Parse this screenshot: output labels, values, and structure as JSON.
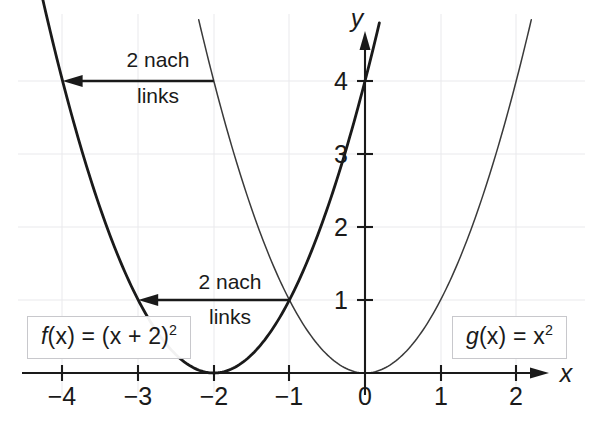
{
  "chart_data": {
    "type": "line",
    "title": "",
    "xlabel": "x",
    "ylabel": "y",
    "xlim": [
      -4.6,
      2.55
    ],
    "ylim": [
      -0.45,
      4.9
    ],
    "grid": true,
    "legend": "inline-boxes",
    "x_ticks": [
      "−4",
      "−3",
      "−2",
      "−1",
      "0",
      "1",
      "2"
    ],
    "x_tick_values": [
      -4,
      -3,
      -2,
      -1,
      0,
      1,
      2
    ],
    "y_ticks": [
      "1",
      "2",
      "3",
      "4"
    ],
    "y_tick_values": [
      1,
      2,
      3,
      4
    ],
    "series": [
      {
        "name": "f(x) = (x + 2)²",
        "expression": "(x + 2)^2",
        "style": "bold",
        "vertex": [
          -2,
          0
        ],
        "x": [
          -4.3,
          -4.0,
          -3.5,
          -3.0,
          -2.5,
          -2.0,
          -1.5,
          -1.0,
          -0.5,
          0.0,
          0.19
        ],
        "values": [
          5.29,
          4.0,
          2.25,
          1.0,
          0.25,
          0.0,
          0.25,
          1.0,
          2.25,
          4.0,
          4.8
        ]
      },
      {
        "name": "g(x) = x²",
        "expression": "x^2",
        "style": "thin",
        "vertex": [
          0,
          0
        ],
        "x": [
          -2.2,
          -2.0,
          -1.5,
          -1.0,
          -0.5,
          0.0,
          0.5,
          1.0,
          1.5,
          2.0,
          2.2
        ],
        "values": [
          4.84,
          4.0,
          2.25,
          1.0,
          0.25,
          0.0,
          0.25,
          1.0,
          2.25,
          4.0,
          4.84
        ]
      }
    ],
    "annotations": [
      {
        "name": "shift-arrow-top",
        "text_line1": "2 nach",
        "text_line2": "links",
        "from_point": [
          -2.0,
          4.0
        ],
        "to_point": [
          -4.0,
          4.0
        ],
        "direction": "left",
        "length_units": 2
      },
      {
        "name": "shift-arrow-bottom",
        "text_line1": "2 nach",
        "text_line2": "links",
        "from_point": [
          -1.0,
          1.0
        ],
        "to_point": [
          -3.0,
          1.0
        ],
        "direction": "left",
        "length_units": 2
      }
    ],
    "colors": {
      "curve_bold": "#1a1a1a",
      "curve_thin": "#3a3a3a",
      "axis": "#1a1a1a",
      "grid": "#e9e9ec",
      "box_border": "#c8c8cc",
      "background": "#ffffff"
    }
  },
  "labels": {
    "x_axis_name": "x",
    "y_axis_name": "y",
    "x_tick_minus4": "−4",
    "x_tick_minus3": "−3",
    "x_tick_minus2": "−2",
    "x_tick_minus1": "−1",
    "x_tick_0": "0",
    "x_tick_1": "1",
    "x_tick_2": "2",
    "y_tick_1": "1",
    "y_tick_2": "2",
    "y_tick_3": "3",
    "y_tick_4": "4"
  },
  "annotations": {
    "top": {
      "line1": "2 nach",
      "line2": "links"
    },
    "bottom": {
      "line1": "2 nach",
      "line2": "links"
    }
  },
  "formulas": {
    "f": {
      "fname": "f",
      "open": "(x) = (x + 2)",
      "exp": "2"
    },
    "g": {
      "gname": "g",
      "open": "(x) = x",
      "exp": "2"
    }
  }
}
